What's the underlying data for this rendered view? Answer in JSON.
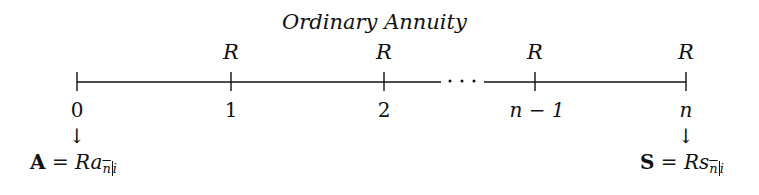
{
  "diagram": {
    "title": "Ordinary Annuity",
    "payment_label": "R",
    "ellipsis": "· · ·",
    "ticks": [
      {
        "label": "0",
        "x": 77,
        "payment": false
      },
      {
        "label": "1",
        "x": 231,
        "payment": true
      },
      {
        "label": "2",
        "x": 384,
        "payment": true
      },
      {
        "label": "n − 1",
        "x": 535,
        "payment": true
      },
      {
        "label": "n",
        "x": 686,
        "payment": true
      }
    ],
    "arrow": "↓",
    "present_value": {
      "lhs": "A",
      "eq": " = ",
      "coef": "R",
      "fn": "a",
      "sub_n": "n",
      "sub_i": "i"
    },
    "future_value": {
      "lhs": "S",
      "eq": " = ",
      "coef": "R",
      "fn": "s",
      "sub_n": "n",
      "sub_i": "i"
    }
  }
}
